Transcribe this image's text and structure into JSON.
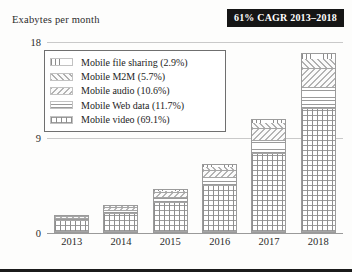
{
  "axis_title": "Exabytes per month",
  "badge": {
    "text": "61% CAGR 2013–2018",
    "bg": "#151515",
    "fg": "#ffffff"
  },
  "legend": {
    "items": [
      {
        "label": "Mobile file sharing (2.9%)",
        "key": "file_sharing"
      },
      {
        "label": "Mobile M2M (5.7%)",
        "key": "m2m"
      },
      {
        "label": "Mobile audio (10.6%)",
        "key": "audio"
      },
      {
        "label": "Mobile Web data (11.7%)",
        "key": "web_data"
      },
      {
        "label": "Mobile video (69.1%)",
        "key": "video"
      }
    ]
  },
  "chart_data": {
    "type": "bar",
    "stacked": true,
    "title": "",
    "xlabel": "",
    "ylabel": "Exabytes per month",
    "categories": [
      "2013",
      "2014",
      "2015",
      "2016",
      "2017",
      "2018"
    ],
    "yticks": [
      0,
      9,
      18
    ],
    "ylim": [
      0,
      18
    ],
    "grid": true,
    "legend_position": "inside-upper-left",
    "annotation": "61% CAGR 2013–2018",
    "series": [
      {
        "name": "Mobile video",
        "share_pct": 69.1,
        "values": [
          1.04,
          1.73,
          2.76,
          4.35,
          7.32,
          11.61
        ]
      },
      {
        "name": "Mobile Web data",
        "share_pct": 11.7,
        "values": [
          0.18,
          0.29,
          0.47,
          0.74,
          1.24,
          1.97
        ]
      },
      {
        "name": "Mobile audio",
        "share_pct": 10.6,
        "values": [
          0.16,
          0.27,
          0.42,
          0.67,
          1.12,
          1.78
        ]
      },
      {
        "name": "Mobile M2M",
        "share_pct": 5.7,
        "values": [
          0.09,
          0.14,
          0.23,
          0.36,
          0.6,
          0.96
        ]
      },
      {
        "name": "Mobile file sharing",
        "share_pct": 2.9,
        "values": [
          0.04,
          0.07,
          0.12,
          0.18,
          0.31,
          0.49
        ]
      }
    ],
    "totals": [
      1.5,
      2.5,
      4.0,
      6.3,
      10.6,
      16.8
    ]
  }
}
